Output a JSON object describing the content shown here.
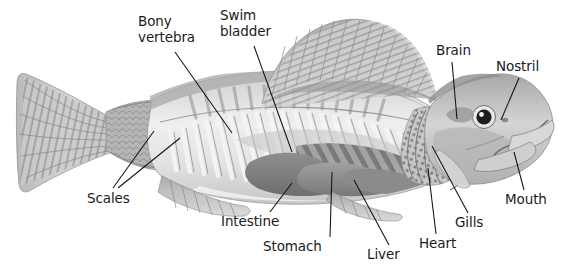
{
  "diagram": {
    "background_color": "#ffffff",
    "text_color": "#1a1a1a",
    "leader_line_color": "#111111",
    "illustration_style": "grayscale-cutaway-engraving",
    "labels": [
      {
        "id": "bony-vertebra",
        "line1": "Bony",
        "line2": "vertebra",
        "x": 138,
        "y": 14,
        "align": "left"
      },
      {
        "id": "swim-bladder",
        "line1": "Swim",
        "line2": "bladder",
        "x": 220,
        "y": 8,
        "align": "left"
      },
      {
        "id": "brain",
        "line1": "Brain",
        "line2": "",
        "x": 436,
        "y": 43,
        "align": "left"
      },
      {
        "id": "nostril",
        "line1": "Nostril",
        "line2": "",
        "x": 496,
        "y": 59,
        "align": "left"
      },
      {
        "id": "scales",
        "line1": "Scales",
        "line2": "",
        "x": 87,
        "y": 191,
        "align": "left"
      },
      {
        "id": "intestine",
        "line1": "Intestine",
        "line2": "",
        "x": 221,
        "y": 214,
        "align": "left"
      },
      {
        "id": "stomach",
        "line1": "Stomach",
        "line2": "",
        "x": 263,
        "y": 239,
        "align": "left"
      },
      {
        "id": "liver",
        "line1": "Liver",
        "line2": "",
        "x": 367,
        "y": 247,
        "align": "left"
      },
      {
        "id": "heart",
        "line1": "Heart",
        "line2": "",
        "x": 419,
        "y": 236,
        "align": "left"
      },
      {
        "id": "gills",
        "line1": "Gills",
        "line2": "",
        "x": 455,
        "y": 215,
        "align": "left"
      },
      {
        "id": "mouth",
        "line1": "Mouth",
        "line2": "",
        "x": 505,
        "y": 192,
        "align": "left"
      }
    ],
    "leader_lines": [
      {
        "id": "bony-vertebra-leader",
        "x1": 175,
        "y1": 52,
        "x2": 232,
        "y2": 133
      },
      {
        "id": "swim-bladder-leader",
        "x1": 254,
        "y1": 46,
        "x2": 292,
        "y2": 152
      },
      {
        "id": "brain-leader",
        "x1": 452,
        "y1": 62,
        "x2": 457,
        "y2": 119
      },
      {
        "id": "nostril-leader",
        "x1": 519,
        "y1": 78,
        "x2": 500,
        "y2": 120
      },
      {
        "id": "scales-leader-a",
        "x1": 113,
        "y1": 188,
        "x2": 154,
        "y2": 131
      },
      {
        "id": "scales-leader-b",
        "x1": 117,
        "y1": 188,
        "x2": 178,
        "y2": 137
      },
      {
        "id": "intestine-leader",
        "x1": 268,
        "y1": 212,
        "x2": 290,
        "y2": 183
      },
      {
        "id": "stomach-leader",
        "x1": 330,
        "y1": 237,
        "x2": 330,
        "y2": 172
      },
      {
        "id": "liver-leader",
        "x1": 389,
        "y1": 245,
        "x2": 352,
        "y2": 180
      },
      {
        "id": "heart-leader",
        "x1": 435,
        "y1": 234,
        "x2": 428,
        "y2": 168
      },
      {
        "id": "gills-leader",
        "x1": 467,
        "y1": 213,
        "x2": 432,
        "y2": 146
      },
      {
        "id": "mouth-leader",
        "x1": 524,
        "y1": 190,
        "x2": 513,
        "y2": 154
      }
    ]
  }
}
